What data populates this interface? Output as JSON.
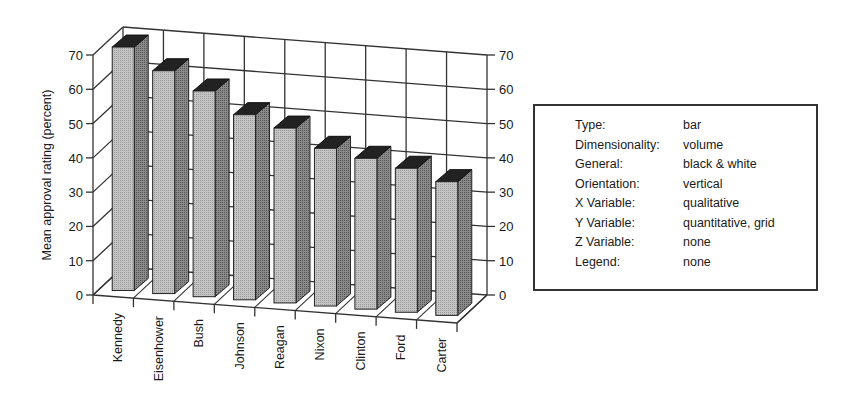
{
  "chart_data": {
    "type": "bar",
    "style": "3d-volume, black & white",
    "title": "",
    "xlabel": "",
    "ylabel": "Mean approval rating (percent)",
    "categories": [
      "Kennedy",
      "Eisenhower",
      "Bush",
      "Johnson",
      "Reagan",
      "Nixon",
      "Clinton",
      "Ford",
      "Carter"
    ],
    "values": [
      71,
      65,
      60,
      54,
      51,
      46,
      44,
      42,
      39
    ],
    "ylim": [
      0,
      70
    ],
    "yticks": [
      0,
      10,
      20,
      30,
      40,
      50,
      60,
      70
    ],
    "ytick_labels": [
      "0",
      "10",
      "20",
      "30",
      "40",
      "50",
      "60",
      "70"
    ],
    "grid": true,
    "legend": "none",
    "axes_on_both_sides": true
  },
  "info_box": {
    "rows": [
      {
        "key": "Type:",
        "value": "bar"
      },
      {
        "key": "Dimensionality:",
        "value": "volume"
      },
      {
        "key": "General:",
        "value": "black & white"
      },
      {
        "key": "Orientation:",
        "value": "vertical"
      },
      {
        "key": "X Variable:",
        "value": "qualitative"
      },
      {
        "key": "Y Variable:",
        "value": "quantitative, grid"
      },
      {
        "key": "Z Variable:",
        "value": "none"
      },
      {
        "key": "Legend:",
        "value": "none"
      }
    ]
  },
  "colors": {
    "bar_front": "#b8b8b8",
    "bar_side": "#7a7a7a",
    "bar_top": "#222222",
    "grid": "#333333",
    "box_border": "#333333"
  }
}
